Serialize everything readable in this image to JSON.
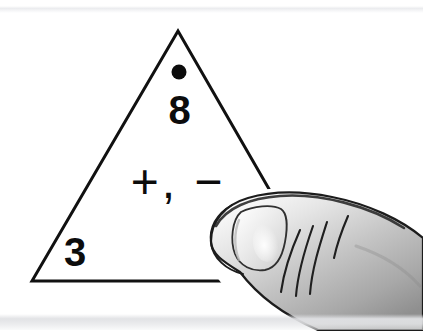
{
  "canvas": {
    "width": 423,
    "height": 332,
    "background_color": "#ffffff",
    "band_color": "#e4e5e8"
  },
  "flashcard": {
    "shape": "triangle",
    "outline_color": "#111111",
    "outline_width": 3,
    "fill_color": "#ffffff",
    "apex": {
      "x": 178,
      "y": 31
    },
    "bottom_left": {
      "x": 32,
      "y": 281
    },
    "bottom_right": {
      "x": 322,
      "y": 281
    },
    "marker_dot": {
      "name": "covered-corner-dot",
      "x": 179,
      "y": 72,
      "radius": 7,
      "color": "#0c0c0c"
    },
    "top_number": "8",
    "operators": "+, −",
    "bottom_left_number": "3",
    "bottom_right_number_hidden": true
  },
  "finger": {
    "label": "thumb-illustration",
    "outline_color": "#1a1a1a",
    "skin_light": "#f2f2f2",
    "skin_mid": "#c9c9c9",
    "skin_dark": "#8e8e8e",
    "nail_color": "#efefef",
    "nail_highlight": "#fbfbfb",
    "crease_count": 4
  }
}
